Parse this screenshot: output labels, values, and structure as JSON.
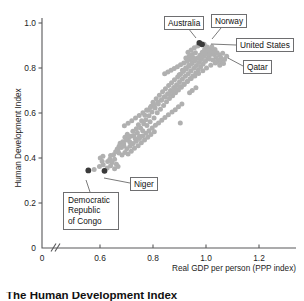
{
  "figure": {
    "caption": "The Human Development Index"
  },
  "chart_data": {
    "type": "scatter",
    "title": "The Human Development Index",
    "xlabel": "Real GDP per person (PPP index)",
    "ylabel": "Human Development Index",
    "xlim": [
      0.5,
      1.3
    ],
    "ylim": [
      0.0,
      1.08
    ],
    "grid": false,
    "legend": null,
    "axis_break_x": true,
    "xticks": [
      {
        "value": 0.0,
        "label": "0",
        "px": 42
      },
      {
        "value": 0.6,
        "label": "0.6",
        "px": 100
      },
      {
        "value": 0.8,
        "label": "0.8",
        "px": 153
      },
      {
        "value": 1.0,
        "label": "1.0",
        "px": 206
      },
      {
        "value": 1.2,
        "label": "1.2",
        "px": 259
      }
    ],
    "yticks": [
      {
        "value": 1.0,
        "label": "1.0",
        "px": 23
      },
      {
        "value": 0.8,
        "label": "0.8",
        "px": 68
      },
      {
        "value": 0.6,
        "label": "0.6",
        "px": 113
      },
      {
        "value": 0.4,
        "label": "0.4",
        "px": 158
      },
      {
        "value": 0.2,
        "label": "0.2",
        "px": 203
      },
      {
        "value": 0.0,
        "label": "0",
        "px": 248
      }
    ],
    "highlighted_points": [
      {
        "name": "Norway",
        "x": 0.975,
        "y": 0.912
      },
      {
        "name": "United States",
        "x": 0.985,
        "y": 0.905
      },
      {
        "name": "Democratic Republic of Congo",
        "x": 0.556,
        "y": 0.345
      },
      {
        "name": "Niger",
        "x": 0.617,
        "y": 0.343
      }
    ],
    "points": [
      {
        "x": 0.556,
        "y": 0.345
      },
      {
        "x": 0.578,
        "y": 0.349
      },
      {
        "x": 0.617,
        "y": 0.343
      },
      {
        "x": 0.601,
        "y": 0.4
      },
      {
        "x": 0.611,
        "y": 0.408
      },
      {
        "x": 0.608,
        "y": 0.386
      },
      {
        "x": 0.629,
        "y": 0.385
      },
      {
        "x": 0.637,
        "y": 0.395
      },
      {
        "x": 0.64,
        "y": 0.411
      },
      {
        "x": 0.646,
        "y": 0.38
      },
      {
        "x": 0.651,
        "y": 0.414
      },
      {
        "x": 0.655,
        "y": 0.395
      },
      {
        "x": 0.662,
        "y": 0.372
      },
      {
        "x": 0.668,
        "y": 0.438
      },
      {
        "x": 0.672,
        "y": 0.452
      },
      {
        "x": 0.676,
        "y": 0.466
      },
      {
        "x": 0.681,
        "y": 0.447
      },
      {
        "x": 0.686,
        "y": 0.472
      },
      {
        "x": 0.69,
        "y": 0.455
      },
      {
        "x": 0.694,
        "y": 0.492
      },
      {
        "x": 0.699,
        "y": 0.48
      },
      {
        "x": 0.703,
        "y": 0.506
      },
      {
        "x": 0.707,
        "y": 0.488
      },
      {
        "x": 0.712,
        "y": 0.472
      },
      {
        "x": 0.716,
        "y": 0.497
      },
      {
        "x": 0.72,
        "y": 0.462
      },
      {
        "x": 0.724,
        "y": 0.519
      },
      {
        "x": 0.728,
        "y": 0.5
      },
      {
        "x": 0.733,
        "y": 0.486
      },
      {
        "x": 0.737,
        "y": 0.53
      },
      {
        "x": 0.741,
        "y": 0.512
      },
      {
        "x": 0.745,
        "y": 0.548
      },
      {
        "x": 0.749,
        "y": 0.497
      },
      {
        "x": 0.753,
        "y": 0.533
      },
      {
        "x": 0.757,
        "y": 0.566
      },
      {
        "x": 0.761,
        "y": 0.521
      },
      {
        "x": 0.765,
        "y": 0.552
      },
      {
        "x": 0.769,
        "y": 0.59
      },
      {
        "x": 0.773,
        "y": 0.57
      },
      {
        "x": 0.777,
        "y": 0.544
      },
      {
        "x": 0.781,
        "y": 0.612
      },
      {
        "x": 0.785,
        "y": 0.588
      },
      {
        "x": 0.789,
        "y": 0.561
      },
      {
        "x": 0.793,
        "y": 0.63
      },
      {
        "x": 0.796,
        "y": 0.604
      },
      {
        "x": 0.8,
        "y": 0.648
      },
      {
        "x": 0.804,
        "y": 0.578
      },
      {
        "x": 0.808,
        "y": 0.622
      },
      {
        "x": 0.812,
        "y": 0.663
      },
      {
        "x": 0.816,
        "y": 0.601
      },
      {
        "x": 0.82,
        "y": 0.64
      },
      {
        "x": 0.824,
        "y": 0.679
      },
      {
        "x": 0.828,
        "y": 0.617
      },
      {
        "x": 0.832,
        "y": 0.657
      },
      {
        "x": 0.836,
        "y": 0.694
      },
      {
        "x": 0.84,
        "y": 0.633
      },
      {
        "x": 0.843,
        "y": 0.672
      },
      {
        "x": 0.847,
        "y": 0.708
      },
      {
        "x": 0.851,
        "y": 0.65
      },
      {
        "x": 0.855,
        "y": 0.686
      },
      {
        "x": 0.859,
        "y": 0.722
      },
      {
        "x": 0.862,
        "y": 0.664
      },
      {
        "x": 0.866,
        "y": 0.7
      },
      {
        "x": 0.87,
        "y": 0.735
      },
      {
        "x": 0.874,
        "y": 0.677
      },
      {
        "x": 0.878,
        "y": 0.713
      },
      {
        "x": 0.881,
        "y": 0.748
      },
      {
        "x": 0.885,
        "y": 0.69
      },
      {
        "x": 0.889,
        "y": 0.726
      },
      {
        "x": 0.893,
        "y": 0.76
      },
      {
        "x": 0.896,
        "y": 0.702
      },
      {
        "x": 0.9,
        "y": 0.739
      },
      {
        "x": 0.904,
        "y": 0.772
      },
      {
        "x": 0.907,
        "y": 0.715
      },
      {
        "x": 0.911,
        "y": 0.751
      },
      {
        "x": 0.915,
        "y": 0.784
      },
      {
        "x": 0.918,
        "y": 0.727
      },
      {
        "x": 0.922,
        "y": 0.763
      },
      {
        "x": 0.926,
        "y": 0.796
      },
      {
        "x": 0.929,
        "y": 0.74
      },
      {
        "x": 0.933,
        "y": 0.775
      },
      {
        "x": 0.936,
        "y": 0.808
      },
      {
        "x": 0.94,
        "y": 0.752
      },
      {
        "x": 0.943,
        "y": 0.787
      },
      {
        "x": 0.947,
        "y": 0.82
      },
      {
        "x": 0.95,
        "y": 0.765
      },
      {
        "x": 0.954,
        "y": 0.799
      },
      {
        "x": 0.957,
        "y": 0.832
      },
      {
        "x": 0.961,
        "y": 0.778
      },
      {
        "x": 0.964,
        "y": 0.811
      },
      {
        "x": 0.967,
        "y": 0.845
      },
      {
        "x": 0.971,
        "y": 0.792
      },
      {
        "x": 0.974,
        "y": 0.824
      },
      {
        "x": 0.977,
        "y": 0.857
      },
      {
        "x": 0.98,
        "y": 0.805
      },
      {
        "x": 0.983,
        "y": 0.838
      },
      {
        "x": 0.986,
        "y": 0.87
      },
      {
        "x": 0.989,
        "y": 0.818
      },
      {
        "x": 0.992,
        "y": 0.851
      },
      {
        "x": 0.995,
        "y": 0.883
      },
      {
        "x": 0.998,
        "y": 0.83
      },
      {
        "x": 1.001,
        "y": 0.862
      },
      {
        "x": 1.004,
        "y": 0.893
      },
      {
        "x": 1.007,
        "y": 0.843
      },
      {
        "x": 1.01,
        "y": 0.873
      },
      {
        "x": 1.013,
        "y": 0.856
      },
      {
        "x": 1.016,
        "y": 0.885
      },
      {
        "x": 1.019,
        "y": 0.866
      },
      {
        "x": 1.022,
        "y": 0.895
      },
      {
        "x": 1.026,
        "y": 0.876
      },
      {
        "x": 1.03,
        "y": 0.86
      },
      {
        "x": 1.034,
        "y": 0.882
      },
      {
        "x": 1.038,
        "y": 0.847
      },
      {
        "x": 1.042,
        "y": 0.868
      },
      {
        "x": 1.046,
        "y": 0.836
      },
      {
        "x": 1.051,
        "y": 0.858
      },
      {
        "x": 1.057,
        "y": 0.845
      },
      {
        "x": 1.063,
        "y": 0.866
      },
      {
        "x": 1.07,
        "y": 0.838
      },
      {
        "x": 1.078,
        "y": 0.852
      },
      {
        "x": 1.052,
        "y": 0.812
      },
      {
        "x": 1.035,
        "y": 0.822
      },
      {
        "x": 1.018,
        "y": 0.812
      },
      {
        "x": 1.002,
        "y": 0.8
      },
      {
        "x": 0.988,
        "y": 0.788
      },
      {
        "x": 0.972,
        "y": 0.776
      },
      {
        "x": 0.958,
        "y": 0.764
      },
      {
        "x": 0.944,
        "y": 0.753
      },
      {
        "x": 0.93,
        "y": 0.741
      },
      {
        "x": 0.916,
        "y": 0.729
      },
      {
        "x": 0.902,
        "y": 0.718
      },
      {
        "x": 0.888,
        "y": 0.706
      },
      {
        "x": 0.874,
        "y": 0.694
      },
      {
        "x": 0.86,
        "y": 0.683
      },
      {
        "x": 0.846,
        "y": 0.671
      },
      {
        "x": 0.832,
        "y": 0.659
      },
      {
        "x": 0.818,
        "y": 0.648
      },
      {
        "x": 0.804,
        "y": 0.636
      },
      {
        "x": 0.79,
        "y": 0.624
      },
      {
        "x": 0.776,
        "y": 0.613
      },
      {
        "x": 0.762,
        "y": 0.601
      },
      {
        "x": 0.748,
        "y": 0.589
      },
      {
        "x": 0.734,
        "y": 0.578
      },
      {
        "x": 0.72,
        "y": 0.566
      },
      {
        "x": 0.706,
        "y": 0.554
      },
      {
        "x": 0.692,
        "y": 0.543
      },
      {
        "x": 0.744,
        "y": 0.455
      },
      {
        "x": 0.756,
        "y": 0.468
      },
      {
        "x": 0.768,
        "y": 0.48
      },
      {
        "x": 0.78,
        "y": 0.492
      },
      {
        "x": 0.792,
        "y": 0.505
      },
      {
        "x": 0.805,
        "y": 0.517
      },
      {
        "x": 0.73,
        "y": 0.443
      },
      {
        "x": 0.718,
        "y": 0.43
      },
      {
        "x": 0.706,
        "y": 0.418
      },
      {
        "x": 0.694,
        "y": 0.425
      },
      {
        "x": 0.683,
        "y": 0.413
      },
      {
        "x": 0.671,
        "y": 0.422
      },
      {
        "x": 0.903,
        "y": 0.555
      },
      {
        "x": 0.948,
        "y": 0.7
      },
      {
        "x": 0.962,
        "y": 0.712
      },
      {
        "x": 0.938,
        "y": 0.69
      },
      {
        "x": 0.909,
        "y": 0.64
      },
      {
        "x": 0.896,
        "y": 0.628
      },
      {
        "x": 0.884,
        "y": 0.615
      },
      {
        "x": 0.872,
        "y": 0.604
      },
      {
        "x": 0.858,
        "y": 0.592
      },
      {
        "x": 0.845,
        "y": 0.58
      },
      {
        "x": 0.833,
        "y": 0.568
      },
      {
        "x": 0.821,
        "y": 0.556
      },
      {
        "x": 0.809,
        "y": 0.545
      },
      {
        "x": 0.797,
        "y": 0.533
      },
      {
        "x": 0.785,
        "y": 0.521
      },
      {
        "x": 0.773,
        "y": 0.51
      },
      {
        "x": 0.761,
        "y": 0.498
      },
      {
        "x": 0.749,
        "y": 0.487
      },
      {
        "x": 0.737,
        "y": 0.475
      },
      {
        "x": 0.725,
        "y": 0.464
      },
      {
        "x": 0.713,
        "y": 0.452
      },
      {
        "x": 0.701,
        "y": 0.441
      },
      {
        "x": 0.689,
        "y": 0.465
      },
      {
        "x": 0.677,
        "y": 0.454
      },
      {
        "x": 0.665,
        "y": 0.44
      },
      {
        "x": 0.659,
        "y": 0.428
      },
      {
        "x": 0.993,
        "y": 0.905
      },
      {
        "x": 0.969,
        "y": 0.898
      },
      {
        "x": 0.956,
        "y": 0.89
      },
      {
        "x": 0.944,
        "y": 0.88
      },
      {
        "x": 0.932,
        "y": 0.87
      },
      {
        "x": 0.948,
        "y": 0.86
      },
      {
        "x": 0.96,
        "y": 0.868
      },
      {
        "x": 0.936,
        "y": 0.852
      },
      {
        "x": 0.924,
        "y": 0.845
      },
      {
        "x": 0.94,
        "y": 0.838
      },
      {
        "x": 0.952,
        "y": 0.846
      },
      {
        "x": 0.928,
        "y": 0.83
      },
      {
        "x": 0.916,
        "y": 0.822
      },
      {
        "x": 0.904,
        "y": 0.815
      },
      {
        "x": 0.892,
        "y": 0.806
      },
      {
        "x": 0.88,
        "y": 0.798
      },
      {
        "x": 0.868,
        "y": 0.79
      },
      {
        "x": 0.856,
        "y": 0.782
      },
      {
        "x": 0.844,
        "y": 0.774
      },
      {
        "x": 0.899,
        "y": 0.77
      },
      {
        "x": 0.911,
        "y": 0.79
      },
      {
        "x": 0.923,
        "y": 0.8
      },
      {
        "x": 0.935,
        "y": 0.812
      },
      {
        "x": 0.947,
        "y": 0.822
      },
      {
        "x": 0.959,
        "y": 0.833
      },
      {
        "x": 0.971,
        "y": 0.843
      },
      {
        "x": 0.983,
        "y": 0.855
      },
      {
        "x": 0.995,
        "y": 0.866
      },
      {
        "x": 1.006,
        "y": 0.878
      },
      {
        "x": 1.013,
        "y": 0.84
      },
      {
        "x": 1.026,
        "y": 0.836
      },
      {
        "x": 1.04,
        "y": 0.826
      },
      {
        "x": 1.055,
        "y": 0.832
      },
      {
        "x": 1.066,
        "y": 0.82
      },
      {
        "x": 0.627,
        "y": 0.356
      },
      {
        "x": 0.64,
        "y": 0.366
      },
      {
        "x": 0.655,
        "y": 0.352
      },
      {
        "x": 0.668,
        "y": 0.362
      },
      {
        "x": 0.612,
        "y": 0.37
      },
      {
        "x": 0.598,
        "y": 0.362
      }
    ]
  },
  "axes": {
    "y_title": "Human Development Index",
    "x_title": "Real GDP per person (PPP index)"
  },
  "callouts": [
    {
      "id": "australia",
      "label": "Australia",
      "lines": [
        "Australia"
      ]
    },
    {
      "id": "norway",
      "label": "Norway",
      "lines": [
        "Norway"
      ]
    },
    {
      "id": "united-states",
      "label": "United States",
      "lines": [
        "United States"
      ]
    },
    {
      "id": "qatar",
      "label": "Qatar",
      "lines": [
        "Qatar"
      ]
    },
    {
      "id": "niger",
      "label": "Niger",
      "lines": [
        "Niger"
      ]
    },
    {
      "id": "drc",
      "label": "Democratic Republic of Congo",
      "lines": [
        "Democratic",
        "Republic",
        "of Congo"
      ]
    }
  ],
  "colors": {
    "dot_grey": "#b0b0b0",
    "dot_dark": "#3a3a3a",
    "axis": "#58585a",
    "box_border": "#6e6e70",
    "text": "#111111"
  }
}
